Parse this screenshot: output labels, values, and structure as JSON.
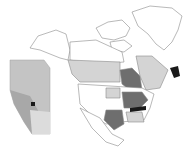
{
  "map": {
    "type": "choropleth",
    "region": "North America",
    "inset": "Alberta",
    "colors": {
      "background": "#ffffff",
      "border": "#8a8a8a",
      "none": "#ffffff",
      "light": "#d4d4d4",
      "medium": "#9a9a9a",
      "dark": "#6e6e6e",
      "highest": "#1a1a1a"
    },
    "highlighted_regions": [
      {
        "name": "Ontario",
        "shade": "dark"
      },
      {
        "name": "Great Lakes states",
        "shade": "dark"
      },
      {
        "name": "Texas",
        "shade": "dark"
      },
      {
        "name": "Tennessee",
        "shade": "highest"
      },
      {
        "name": "Newfoundland",
        "shade": "highest"
      },
      {
        "name": "Western Canada provinces",
        "shade": "light"
      },
      {
        "name": "Quebec",
        "shade": "light"
      }
    ],
    "inset_marker": {
      "label": "site",
      "shade": "highest"
    }
  }
}
